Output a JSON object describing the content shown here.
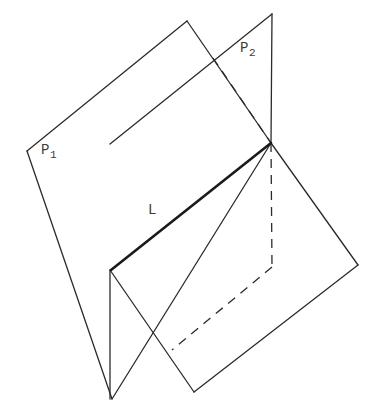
{
  "figure": {
    "background_color": "#ffffff",
    "stroke_color": "#2b2b2b",
    "intersection_stroke_color": "#1a1a1a",
    "width": 379,
    "height": 416
  },
  "labels": {
    "plane1": {
      "base": "P",
      "subscript": "1",
      "text": "P1",
      "x": 41,
      "y": 143
    },
    "plane2": {
      "base": "P",
      "subscript": "2",
      "text": "P2",
      "x": 240,
      "y": 41
    },
    "line": {
      "base": "L",
      "subscript": "",
      "text": "L",
      "x": 148,
      "y": 203
    }
  },
  "geometry": {
    "plane1": {
      "name": "P1",
      "vertices": [
        {
          "x": 187,
          "y": 21
        },
        {
          "x": 271,
          "y": 143
        },
        {
          "x": 112,
          "y": 399
        },
        {
          "x": 27,
          "y": 151
        }
      ],
      "solid_edges": [
        {
          "from": {
            "x": 27,
            "y": 151
          },
          "to": {
            "x": 187,
            "y": 21
          }
        },
        {
          "from": {
            "x": 187,
            "y": 21
          },
          "to": {
            "x": 271,
            "y": 143
          }
        },
        {
          "from": {
            "x": 271,
            "y": 143
          },
          "to": {
            "x": 112,
            "y": 399
          }
        },
        {
          "from": {
            "x": 112,
            "y": 399
          },
          "to": {
            "x": 27,
            "y": 151
          }
        }
      ]
    },
    "plane2": {
      "name": "P2",
      "vertices": [
        {
          "x": 272,
          "y": 14
        },
        {
          "x": 358,
          "y": 265
        },
        {
          "x": 194,
          "y": 392
        },
        {
          "x": 110,
          "y": 144
        }
      ],
      "solid_edges": [
        {
          "from": {
            "x": 110,
            "y": 144
          },
          "to": {
            "x": 272,
            "y": 14
          }
        },
        {
          "from": {
            "x": 272,
            "y": 14
          },
          "to": {
            "x": 271,
            "y": 143
          }
        },
        {
          "from": {
            "x": 271,
            "y": 143
          },
          "to": {
            "x": 358,
            "y": 265
          }
        },
        {
          "from": {
            "x": 358,
            "y": 265
          },
          "to": {
            "x": 194,
            "y": 392
          }
        },
        {
          "from": {
            "x": 194,
            "y": 392
          },
          "to": {
            "x": 110,
            "y": 270
          }
        },
        {
          "from": {
            "x": 110,
            "y": 270
          },
          "to": {
            "x": 110,
            "y": 399
          }
        }
      ],
      "hidden_edges": [
        {
          "from": {
            "x": 213,
            "y": 58
          },
          "to": {
            "x": 271,
            "y": 143
          }
        },
        {
          "from": {
            "x": 271,
            "y": 143
          },
          "to": {
            "x": 272,
            "y": 267
          }
        },
        {
          "from": {
            "x": 272,
            "y": 267
          },
          "to": {
            "x": 172,
            "y": 350
          }
        }
      ]
    },
    "intersection_line": {
      "name": "L",
      "from": {
        "x": 111,
        "y": 270
      },
      "to": {
        "x": 271,
        "y": 143
      }
    },
    "crossing_points": [
      {
        "x": 213,
        "y": 58
      },
      {
        "x": 168,
        "y": 352
      },
      {
        "x": 111,
        "y": 270
      },
      {
        "x": 271,
        "y": 143
      }
    ]
  }
}
